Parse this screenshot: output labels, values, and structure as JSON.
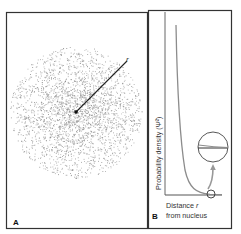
{
  "panels": {
    "a": {
      "label": "A",
      "radius_label": "r",
      "description": "Electron probability cloud (1s orbital) with radius vector from nucleus"
    },
    "b": {
      "label": "B",
      "y_axis_label": "Probability density (Ψ²)",
      "x_axis_label_line1": "Distance ",
      "x_axis_label_r": "r",
      "x_axis_label_line2": "from nucleus"
    }
  },
  "colors": {
    "frame": "#333333",
    "dots": "#8a8a8a",
    "curve": "#8c8c8c",
    "axis": "#555555",
    "arrow": "#999999"
  },
  "chart_data": {
    "type": "line",
    "title": "",
    "xlabel": "Distance r from nucleus",
    "ylabel": "Probability density (Ψ²)",
    "series": [
      {
        "name": "Ψ² (1s)",
        "x": [
          0.0,
          0.1,
          0.2,
          0.3,
          0.4,
          0.5,
          0.6,
          0.7,
          0.8,
          0.9,
          1.0
        ],
        "values": [
          1.0,
          0.67,
          0.45,
          0.3,
          0.2,
          0.14,
          0.09,
          0.06,
          0.04,
          0.02,
          0.01
        ]
      }
    ],
    "annotations": [
      "magnified inset showing curve approaching but not reaching zero"
    ],
    "grid": false,
    "legend": "none"
  }
}
